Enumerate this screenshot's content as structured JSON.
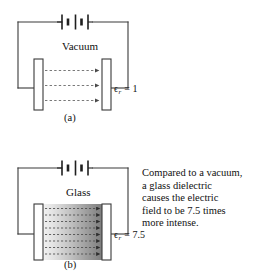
{
  "figure": {
    "title_semantic": "dielectric-constant-comparison",
    "background_color": "#ffffff",
    "line_color": "#3a3a3a",
    "panels": [
      {
        "id": "a",
        "letter": "(a)",
        "medium_label": "Vacuum",
        "permittivity_symbol": "ϵ",
        "permittivity_subscript": "r",
        "permittivity_equals": " = 1",
        "permittivity_value": "1",
        "field_line_count": 3,
        "dielectric_fill": "none"
      },
      {
        "id": "b",
        "letter": "(b)",
        "medium_label": "Glass",
        "permittivity_symbol": "ϵ",
        "permittivity_subscript": "r",
        "permittivity_equals": " = 7.5",
        "permittivity_value": "7.5",
        "field_line_count": 8,
        "dielectric_fill": "gradient-gray"
      }
    ],
    "caption": {
      "lines": [
        "Compared to a vacuum,",
        "a glass dielectric",
        "causes the electric",
        "field to be 7.5 times",
        "more intense."
      ]
    },
    "icons": {
      "battery": "battery-icon",
      "capacitor_plate": "capacitor-plate-icon",
      "field_arrow": "electric-field-arrow-icon"
    }
  }
}
